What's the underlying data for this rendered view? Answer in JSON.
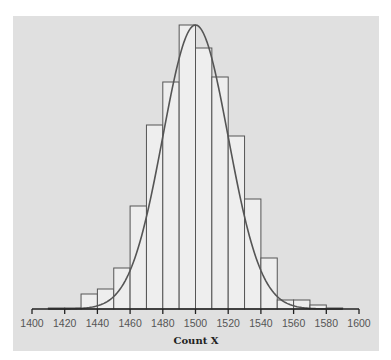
{
  "chart_data": {
    "type": "bar",
    "subtype": "histogram_with_normal_curve",
    "title": "",
    "xlabel": "Count X",
    "ylabel": "",
    "xlim": [
      1400,
      1600
    ],
    "x_ticks": [
      1400,
      1420,
      1440,
      1460,
      1480,
      1500,
      1520,
      1540,
      1560,
      1580,
      1600
    ],
    "x_tick_labels": [
      "1400",
      "1420",
      "1440",
      "1460",
      "1480",
      "1500",
      "1520",
      "1540",
      "1560",
      "1580",
      "1600"
    ],
    "bin_width": 10,
    "bins": [
      {
        "start": 1410,
        "end": 1420,
        "height": 1
      },
      {
        "start": 1420,
        "end": 1430,
        "height": 1
      },
      {
        "start": 1430,
        "end": 1440,
        "height": 15
      },
      {
        "start": 1440,
        "end": 1450,
        "height": 20
      },
      {
        "start": 1450,
        "end": 1460,
        "height": 41
      },
      {
        "start": 1460,
        "end": 1470,
        "height": 103
      },
      {
        "start": 1470,
        "end": 1480,
        "height": 184
      },
      {
        "start": 1480,
        "end": 1490,
        "height": 227
      },
      {
        "start": 1490,
        "end": 1500,
        "height": 284
      },
      {
        "start": 1500,
        "end": 1510,
        "height": 261
      },
      {
        "start": 1510,
        "end": 1520,
        "height": 232
      },
      {
        "start": 1520,
        "end": 1530,
        "height": 173
      },
      {
        "start": 1530,
        "end": 1540,
        "height": 110
      },
      {
        "start": 1540,
        "end": 1550,
        "height": 51
      },
      {
        "start": 1550,
        "end": 1560,
        "height": 9
      },
      {
        "start": 1560,
        "end": 1570,
        "height": 9
      },
      {
        "start": 1570,
        "end": 1580,
        "height": 4
      },
      {
        "start": 1580,
        "end": 1590,
        "height": 1
      }
    ],
    "height_units": "relative (pixels above baseline; y-axis unlabeled)",
    "normal_curve": {
      "mean": 1500,
      "sd": 20,
      "peak_height": 284,
      "x_range": [
        1410,
        1590
      ]
    },
    "grid": false,
    "legend": null
  },
  "colors": {
    "panel_background": "#e0e0e0",
    "bar_fill": "#eeeeee",
    "bar_stroke": "#555555",
    "curve_stroke": "#555555",
    "axis": "#222222"
  }
}
